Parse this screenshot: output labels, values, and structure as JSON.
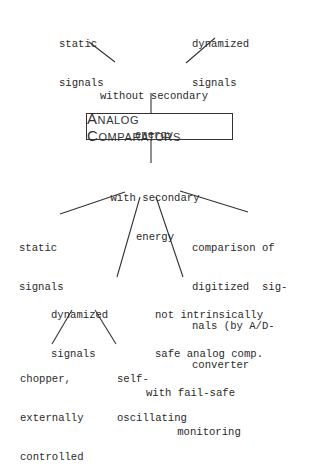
{
  "diagram": {
    "root": "Analog Comparators",
    "upper_branch": {
      "label": [
        "without secondary",
        "energy"
      ],
      "children": [
        {
          "label": [
            "static",
            "signals"
          ]
        },
        {
          "label": [
            "dynamized",
            "signals"
          ]
        }
      ]
    },
    "lower_branch": {
      "label": [
        "with secondary",
        "energy"
      ],
      "children": [
        {
          "label": [
            "static",
            "signals"
          ]
        },
        {
          "label": [
            "dynamized",
            "signals"
          ],
          "children": [
            {
              "label": [
                "chopper,",
                "externally",
                "controlled"
              ]
            },
            {
              "label": [
                "self-",
                "oscillating"
              ]
            }
          ]
        },
        {
          "label": [
            "not intrinsically",
            "safe analog comp.",
            "with fail-safe",
            "monitoring"
          ]
        },
        {
          "label": [
            "comparison of",
            "digitized  sig-",
            "nals (by A/D-",
            "converter"
          ]
        }
      ]
    }
  }
}
